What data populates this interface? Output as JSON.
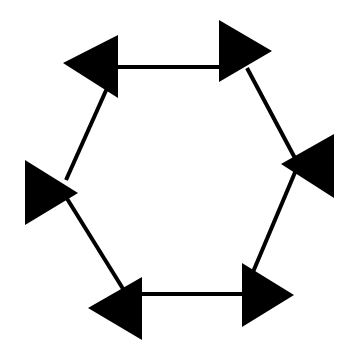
{
  "diagram": {
    "description": "Hexagon of six line segments with six filled black triangular arrowheads at the vertices; the top and bottom edges are double-headed horizontal arrows",
    "colors": {
      "background": "#ffffff",
      "stroke": "#000000",
      "arrowhead_fill": "#000000"
    },
    "stroke_width": 4,
    "edges": [
      {
        "name": "top-edge",
        "x1": 118,
        "y1": 67,
        "x2": 220,
        "y2": 67
      },
      {
        "name": "upper-right-edge",
        "x1": 247,
        "y1": 68,
        "x2": 296,
        "y2": 160
      },
      {
        "name": "lower-right-edge",
        "x1": 296,
        "y1": 170,
        "x2": 253,
        "y2": 272
      },
      {
        "name": "bottom-edge",
        "x1": 142,
        "y1": 294,
        "x2": 243,
        "y2": 294
      },
      {
        "name": "lower-left-edge",
        "x1": 125,
        "y1": 292,
        "x2": 66,
        "y2": 197
      },
      {
        "name": "upper-left-edge",
        "x1": 66,
        "y1": 180,
        "x2": 108,
        "y2": 86
      }
    ],
    "arrowheads": [
      {
        "name": "top-left-arrowhead",
        "direction": "left",
        "points": "63,63 118,35 118,98"
      },
      {
        "name": "top-right-arrowhead",
        "direction": "right",
        "points": "219,20 272,51 219,82"
      },
      {
        "name": "right-arrowhead",
        "direction": "left",
        "points": "281,164 334,134 334,198"
      },
      {
        "name": "left-arrowhead",
        "direction": "right",
        "points": "25,160 78,193 25,225"
      },
      {
        "name": "bottom-left-arrowhead",
        "direction": "left",
        "points": "88,308 142,277 142,340"
      },
      {
        "name": "bottom-right-arrowhead",
        "direction": "right",
        "points": "242,263 294,295 242,327"
      }
    ]
  }
}
